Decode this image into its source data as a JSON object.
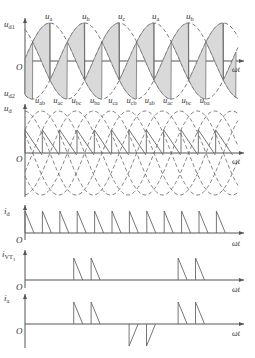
{
  "figure": {
    "caption_visible": false,
    "panels": [
      {
        "id": "panel-ud1-ud2",
        "y_label_top": "u_d1",
        "y_label_bottom": "u_d2",
        "x_label": "ωt",
        "origin_label": "O",
        "curve_labels": [
          "u_a",
          "u_b",
          "u_c",
          "u_a",
          "u_b"
        ]
      },
      {
        "id": "panel-ud",
        "y_label": "u_d",
        "x_label": "ωt",
        "origin_label": "O",
        "curve_labels": [
          "u_ab",
          "u_ac",
          "u_bc",
          "u_ba",
          "u_ca",
          "u_cb",
          "u_ab",
          "u_ac",
          "u_bc",
          "u_ba"
        ]
      },
      {
        "id": "panel-id",
        "y_label": "i_d",
        "x_label": "ωt",
        "origin_label": "O",
        "pulse_count": 12
      },
      {
        "id": "panel-ivt1",
        "y_label": "i_VT1",
        "x_label": "ωt",
        "origin_label": "O",
        "pulse_groups": [
          [
            3,
            4
          ],
          [
            9,
            10
          ]
        ]
      },
      {
        "id": "panel-ia",
        "y_label": "i_a",
        "x_label": "ωt",
        "origin_label": "O",
        "positive_pulse_groups": [
          [
            3,
            4
          ],
          [
            9,
            10
          ]
        ],
        "negative_pulse_groups": [
          [
            6,
            7
          ]
        ]
      }
    ],
    "colors": {
      "axis": "#555555",
      "curve": "#666666",
      "shade": "#d9d9d9",
      "text": "#333333"
    },
    "texts": {
      "ud1": "u",
      "ud1_sub": "d1",
      "ud2": "u",
      "ud2_sub": "d2",
      "ud": "u",
      "ud_sub": "d",
      "id": "i",
      "id_sub": "d",
      "ivt": "i",
      "ivt_sub": "VT",
      "ivt_subsub": "1",
      "ia": "i",
      "ia_sub": "a",
      "origin": "O",
      "omega_t": "ωt"
    }
  }
}
